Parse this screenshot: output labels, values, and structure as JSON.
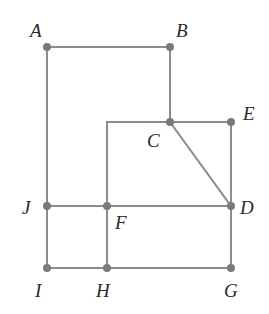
{
  "diagram": {
    "type": "geometry-grid",
    "style": {
      "line_color": "#8c8c8c",
      "line_width": 2,
      "point_color": "#7a7a7a",
      "point_radius": 4,
      "label_color": "#2a2a2a",
      "background": "#ffffff"
    },
    "points": [
      {
        "id": "A",
        "label": "A",
        "x": 47,
        "y": 47,
        "label_x": 30,
        "label_y": 37,
        "dot": true
      },
      {
        "id": "B",
        "label": "B",
        "x": 170,
        "y": 47,
        "label_x": 176,
        "label_y": 37,
        "dot": true
      },
      {
        "id": "C",
        "label": "C",
        "x": 170,
        "y": 122,
        "label_x": 147,
        "label_y": 147,
        "dot": true
      },
      {
        "id": "E",
        "label": "E",
        "x": 231,
        "y": 122,
        "label_x": 243,
        "label_y": 120,
        "dot": true
      },
      {
        "id": "J",
        "label": "J",
        "x": 47,
        "y": 206,
        "label_x": 22,
        "label_y": 214,
        "dot": true
      },
      {
        "id": "F",
        "label": "F",
        "x": 107,
        "y": 206,
        "label_x": 115,
        "label_y": 229,
        "dot": true
      },
      {
        "id": "D",
        "label": "D",
        "x": 231,
        "y": 206,
        "label_x": 240,
        "label_y": 214,
        "dot": true
      },
      {
        "id": "I",
        "label": "I",
        "x": 47,
        "y": 268,
        "label_x": 35,
        "label_y": 297,
        "dot": true
      },
      {
        "id": "H",
        "label": "H",
        "x": 107,
        "y": 268,
        "label_x": 96,
        "label_y": 297,
        "dot": true
      },
      {
        "id": "G",
        "label": "G",
        "x": 231,
        "y": 268,
        "label_x": 224,
        "label_y": 297,
        "dot": true
      }
    ],
    "corners": [
      {
        "id": "K",
        "x": 107,
        "y": 122
      }
    ],
    "segments": [
      {
        "from": "A",
        "to": "B"
      },
      {
        "from": "B",
        "to": "C"
      },
      {
        "from": "C",
        "to": "E"
      },
      {
        "from": "K",
        "to": "C"
      },
      {
        "from": "K",
        "to": "F"
      },
      {
        "from": "E",
        "to": "D"
      },
      {
        "from": "C",
        "to": "D"
      },
      {
        "from": "A",
        "to": "J"
      },
      {
        "from": "J",
        "to": "I"
      },
      {
        "from": "J",
        "to": "F"
      },
      {
        "from": "F",
        "to": "D"
      },
      {
        "from": "F",
        "to": "H"
      },
      {
        "from": "D",
        "to": "G"
      },
      {
        "from": "I",
        "to": "H"
      },
      {
        "from": "H",
        "to": "G"
      }
    ]
  }
}
